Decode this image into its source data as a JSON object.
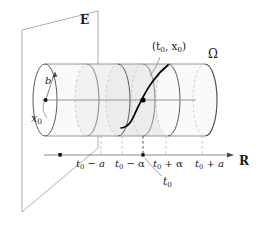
{
  "figure": {
    "background_color": "#ffffff",
    "width": 264,
    "height": 236
  },
  "colors": {
    "stroke": "#8a8a8a",
    "stroke_dark": "#1a1a1a",
    "cylinder_fill": "#f2f2f2",
    "cylinder_fill_light": "#fafafa",
    "plane_stroke": "#9a9a9a",
    "dashed": "#b0b0b0",
    "text": "#1a1a1a",
    "curve": "#000000"
  },
  "labels": {
    "plane": {
      "text": "E",
      "name": "plane-label-E",
      "meaning": "Banach space E",
      "x": 83,
      "y": 20
    },
    "domain": {
      "text": "Ω",
      "name": "domain-label-omega",
      "meaning": "open domain Omega",
      "x": 211,
      "y": 55
    },
    "real_line": {
      "text": "R",
      "name": "axis-label-R",
      "meaning": "real line R",
      "x": 240,
      "y": 161
    },
    "radius": {
      "text": "b",
      "name": "radius-label-b",
      "meaning": "ball radius b",
      "x": 48,
      "y": 82
    },
    "initial_point_x": {
      "text": "x",
      "sub": "0",
      "name": "initial-value-label-x0",
      "meaning": "initial value x0",
      "x": 36,
      "y": 110
    },
    "initial_pair": {
      "text": "(t",
      "sub1": "0",
      "mid": ", x",
      "sub2": "0",
      "close": ")",
      "full": "(t0, x0)",
      "name": "initial-condition-label",
      "meaning": "initial condition point (t0, x0)",
      "x": 155,
      "y": 48
    },
    "t0_callout": {
      "text": "t",
      "sub": "0",
      "name": "callout-label-t0",
      "meaning": "center time t0",
      "x": 165,
      "y": 180
    }
  },
  "axis": {
    "name": "real-axis",
    "y": 155,
    "x_start": 44,
    "x_end": 232,
    "origin_dot": {
      "x": 60,
      "y": 155,
      "name": "axis-origin-dot"
    },
    "center_dot": {
      "x": 143,
      "y": 155,
      "name": "axis-center-dot-t0"
    },
    "ticks": [
      {
        "id": "t0-minus-a",
        "label_main": "t",
        "label_sub": "0",
        "label_op": " − ",
        "label_tail": "a",
        "full": "t0 − a",
        "x": 101,
        "label_x": 80,
        "label_y": 162,
        "emphasis": false
      },
      {
        "id": "t0-minus-alpha",
        "label_main": "t",
        "label_sub": "0",
        "label_op": " − ",
        "label_tail": "α",
        "full": "t0 − α",
        "x": 122,
        "label_x": 118,
        "label_y": 162,
        "emphasis": false
      },
      {
        "id": "t0-plus-alpha",
        "label_main": "t",
        "label_sub": "0",
        "label_op": " + ",
        "label_tail": "α",
        "full": "t0 + α",
        "x": 166,
        "label_x": 155,
        "label_y": 162,
        "emphasis": false
      },
      {
        "id": "t0-plus-a",
        "label_main": "t",
        "label_sub": "0",
        "label_op": " + ",
        "label_tail": "a",
        "full": "t0 + a",
        "x": 202,
        "label_x": 196,
        "label_y": 162,
        "emphasis": false
      }
    ]
  },
  "cylinder": {
    "name": "solution-cylinder",
    "axis_y": 100,
    "left_x": 45,
    "right_x": 205,
    "ellipse_ry": 36,
    "ellipse_rx": 12,
    "cross_sections": [
      {
        "id": "left-cap",
        "cx": 45,
        "style": "solid",
        "name": "cylinder-left-cap"
      },
      {
        "id": "t0-minus-a",
        "cx": 87,
        "style": "solid",
        "name": "cross-section-t0-minus-a"
      },
      {
        "id": "t0-minus-alpha",
        "cx": 118,
        "style": "solid",
        "name": "cross-section-t0-minus-alpha"
      },
      {
        "id": "t0",
        "cx": 143,
        "style": "solid",
        "name": "cross-section-t0"
      },
      {
        "id": "t0-plus-alpha",
        "cx": 168,
        "style": "solid",
        "name": "cross-section-t0-plus-alpha"
      },
      {
        "id": "right-cap",
        "cx": 205,
        "style": "solid",
        "name": "cylinder-right-cap"
      }
    ]
  },
  "plane": {
    "name": "banach-plane-E",
    "points": "22,30 98,11 98,148 22,212"
  },
  "solution_curve": {
    "name": "solution-curve",
    "description": "S-shaped integral curve through the initial point",
    "point": {
      "x": 143,
      "y": 100,
      "name": "initial-point-dot"
    }
  }
}
